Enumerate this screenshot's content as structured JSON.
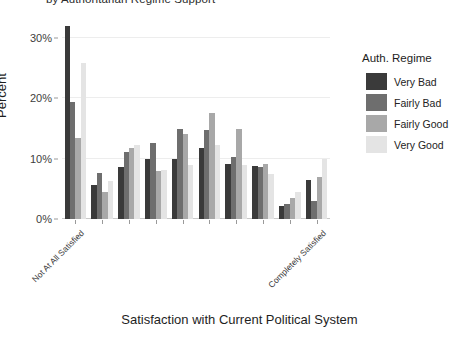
{
  "chart_data": {
    "type": "bar",
    "title": "by Authoritarian Regime Support",
    "xlabel": "Satisfaction with Current Political System",
    "ylabel": "Percent",
    "grid": true,
    "legend_position": "right",
    "legend_title": "Auth. Regime",
    "ylim": [
      0,
      33
    ],
    "yticks": [
      0,
      10,
      20,
      30
    ],
    "ytick_labels": [
      "0%",
      "10%",
      "20%",
      "30%"
    ],
    "categories": [
      "1",
      "2",
      "3",
      "4",
      "5",
      "6",
      "7",
      "8",
      "9",
      "10"
    ],
    "xtick_labels": [
      "Not At All Satisfied",
      "Completely Satisfied"
    ],
    "xtick_label_positions": [
      0,
      9
    ],
    "series": [
      {
        "name": "Very Bad",
        "color": "#3a3a3a",
        "values": [
          32.0,
          5.7,
          8.7,
          10.0,
          10.0,
          11.8,
          9.1,
          8.8,
          2.2,
          6.4
        ]
      },
      {
        "name": "Fairly Bad",
        "color": "#6e6e6e",
        "values": [
          19.4,
          7.6,
          11.1,
          12.6,
          14.9,
          14.8,
          10.3,
          8.7,
          2.5,
          3.0
        ]
      },
      {
        "name": "Fairly Good",
        "color": "#a8a8a8",
        "values": [
          13.4,
          4.5,
          11.8,
          8.0,
          14.1,
          17.6,
          14.9,
          9.2,
          3.5,
          6.9
        ]
      },
      {
        "name": "Very Good",
        "color": "#e4e4e4",
        "values": [
          25.9,
          6.3,
          12.3,
          8.2,
          9.0,
          12.2,
          8.9,
          7.4,
          4.5,
          9.9
        ]
      }
    ]
  }
}
